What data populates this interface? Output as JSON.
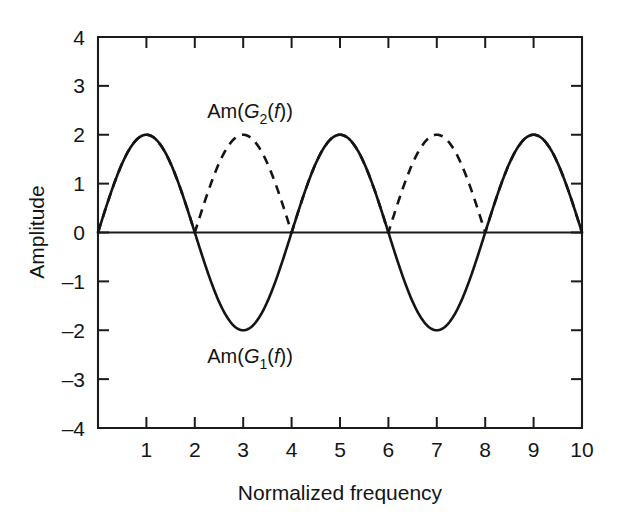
{
  "chart_data": {
    "type": "line",
    "title": "",
    "xlabel": "Normalized frequency",
    "ylabel": "Amplitude",
    "xlim": [
      0,
      10
    ],
    "ylim": [
      -4,
      4
    ],
    "grid": false,
    "legend_position": "inline-annotation",
    "x_ticks": [
      1,
      2,
      3,
      4,
      5,
      6,
      7,
      8,
      9,
      10
    ],
    "x_tick_labels": [
      "1",
      "2",
      "3",
      "4",
      "5",
      "6",
      "7",
      "8",
      "9",
      "10"
    ],
    "y_ticks": [
      4,
      3,
      2,
      1,
      0,
      -1,
      -2,
      -3,
      -4
    ],
    "y_tick_labels": [
      "4",
      "3",
      "2",
      "1",
      "0",
      "–1",
      "–2",
      "–3",
      "–4"
    ],
    "annotations": [
      {
        "name": "g2-label",
        "text": "Am(G₂(f))",
        "x": 3.0,
        "y": 2.75
      },
      {
        "name": "g1-label",
        "text": "Am(G₁(f))",
        "x": 3.0,
        "y": -2.45
      }
    ],
    "series": [
      {
        "name": "Am(G1(f))",
        "style": "solid",
        "color": "#141414",
        "formula": "2*sin(pi*x/2)",
        "x": [
          0,
          0.5,
          1,
          1.5,
          2,
          2.5,
          3,
          3.5,
          4,
          4.5,
          5,
          5.5,
          6,
          6.5,
          7,
          7.5,
          8,
          8.5,
          9,
          9.5,
          10
        ],
        "values": [
          0,
          1.414,
          2,
          1.414,
          0,
          -1.414,
          -2,
          -1.414,
          0,
          1.414,
          2,
          1.414,
          0,
          -1.414,
          -2,
          -1.414,
          0,
          1.414,
          2,
          1.414,
          0
        ]
      },
      {
        "name": "Am(G2(f))",
        "style": "dashed",
        "color": "#141414",
        "formula": "2*|sin(pi*x/2)|",
        "x": [
          0,
          0.5,
          1,
          1.5,
          2,
          2.5,
          3,
          3.5,
          4,
          4.5,
          5,
          5.5,
          6,
          6.5,
          7,
          7.5,
          8,
          8.5,
          9,
          9.5,
          10
        ],
        "values": [
          0,
          1.414,
          2,
          1.414,
          0,
          1.414,
          2,
          1.414,
          0,
          1.414,
          2,
          1.414,
          0,
          1.414,
          2,
          1.414,
          0,
          1.414,
          2,
          1.414,
          0
        ]
      }
    ],
    "labels": {
      "g2_prefix": "Am(",
      "g2_base": "G",
      "g2_sub": "2",
      "g2_mid": "(",
      "g2_var": "f",
      "g2_suffix": "))",
      "g1_prefix": "Am(",
      "g1_base": "G",
      "g1_sub": "1",
      "g1_mid": "(",
      "g1_var": "f",
      "g1_suffix": "))"
    },
    "zero_line": true
  }
}
